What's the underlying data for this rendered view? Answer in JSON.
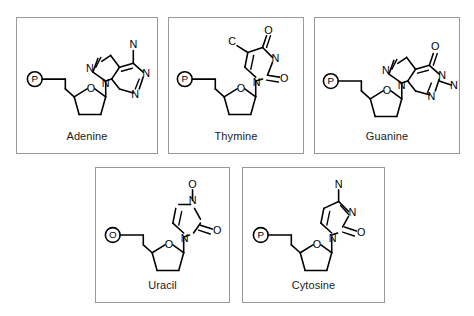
{
  "figure": {
    "background_color": "#ffffff",
    "border_color": "#9a9a9a",
    "bond_color": "#000000",
    "text_color": "#1a1a1a"
  },
  "panels": [
    {
      "id": "adenine",
      "label": "Adenine",
      "base_type": "purine",
      "sugar": "deoxyribose",
      "phosphate_glyph": "P",
      "ring_oxygen_glyph": "O",
      "atom_labels": [
        "N",
        "N",
        "N",
        "N",
        "O",
        "P"
      ],
      "base_atoms": {
        "exocyclic_top": "N",
        "imidazole_n7": "N",
        "imidazole_n9": "N",
        "pyrimidine_n1": "N",
        "pyrimidine_n3": "N"
      }
    },
    {
      "id": "thymine",
      "label": "Thymine",
      "base_type": "pyrimidine",
      "sugar": "deoxyribose",
      "phosphate_glyph": "P",
      "ring_oxygen_glyph": "O",
      "atom_labels": [
        "O",
        "O",
        "N",
        "N",
        "C",
        "O",
        "P"
      ],
      "base_atoms": {
        "methyl": "C",
        "carbonyl_top": "O",
        "carbonyl_right": "O",
        "ring_n3": "N",
        "ring_n1": "N"
      }
    },
    {
      "id": "guanine",
      "label": "Guanine",
      "base_type": "purine",
      "sugar": "deoxyribose",
      "phosphate_glyph": "P",
      "ring_oxygen_glyph": "O",
      "atom_labels": [
        "O",
        "N",
        "N",
        "N",
        "N",
        "O",
        "P"
      ],
      "base_atoms": {
        "carbonyl_top": "O",
        "imidazole_n7": "N",
        "imidazole_n9": "N",
        "ring_n1": "N",
        "ring_n3": "N",
        "exocyclic_amine": "N"
      }
    },
    {
      "id": "uracil",
      "label": "Uracil",
      "base_type": "pyrimidine",
      "sugar": "deoxyribose",
      "phosphate_glyph": "P",
      "ring_oxygen_glyph": "O",
      "atom_labels": [
        "O",
        "N",
        "N",
        "O",
        "O",
        "P"
      ],
      "base_atoms": {
        "carbonyl_top": "O",
        "ring_n_top": "N",
        "ring_n_bottom": "N",
        "carbonyl_right": "O"
      }
    },
    {
      "id": "cytosine",
      "label": "Cytosine",
      "base_type": "pyrimidine",
      "sugar": "deoxyribose",
      "phosphate_glyph": "P",
      "ring_oxygen_glyph": "O",
      "atom_labels": [
        "N",
        "N",
        "N",
        "O",
        "O",
        "P"
      ],
      "base_atoms": {
        "exocyclic_amine": "N",
        "ring_n3": "N",
        "ring_n1": "N",
        "carbonyl_right": "O"
      }
    }
  ]
}
